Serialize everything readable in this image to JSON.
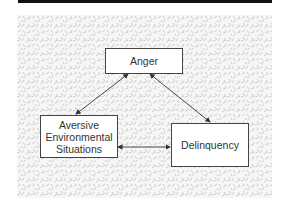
{
  "diagram": {
    "type": "causal-triangle",
    "nodes": [
      {
        "id": "anger",
        "label": "Anger"
      },
      {
        "id": "aversive",
        "lines": [
          "Aversive",
          "Environmental",
          "Situations"
        ]
      },
      {
        "id": "delinquency",
        "label": "Delinquency"
      }
    ],
    "edges": [
      {
        "from": "anger",
        "to": "aversive",
        "direction": "bidirectional"
      },
      {
        "from": "anger",
        "to": "delinquency",
        "direction": "bidirectional"
      },
      {
        "from": "aversive",
        "to": "delinquency",
        "direction": "bidirectional"
      }
    ],
    "colors": {
      "header_bar": "#111111",
      "box_border": "#444444",
      "box_fill": "#ffffff",
      "arrow": "#333333",
      "texture": "#bdbdbd",
      "text": "#333333"
    }
  }
}
